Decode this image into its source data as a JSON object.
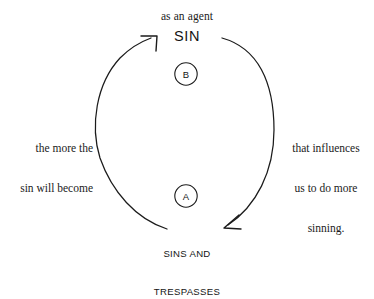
{
  "diagram": {
    "type": "cycle-diagram",
    "background_color": "#ffffff",
    "stroke_color": "#1b1b1b",
    "text_color": "#1b1b1b",
    "top_caption": "as an agent",
    "nodes": [
      {
        "id": "sin",
        "label": "SIN",
        "marker": "B",
        "position": "top"
      },
      {
        "id": "sins-and-trespasses",
        "label_line1": "SINS AND",
        "label_line2": "TRESPASSES",
        "marker": "A",
        "position": "bottom"
      }
    ],
    "edges": [
      {
        "id": "right-arc",
        "from": "sin",
        "to": "sins-and-trespasses",
        "direction": "clockwise-down",
        "caption_line1": "that influences",
        "caption_line2": "us to do more",
        "caption_line3": "sinning."
      },
      {
        "id": "left-arc",
        "from": "sins-and-trespasses",
        "to": "sin",
        "direction": "counterclockwise-up",
        "caption_line1": "the more the",
        "caption_line2": "sin will become"
      }
    ]
  }
}
